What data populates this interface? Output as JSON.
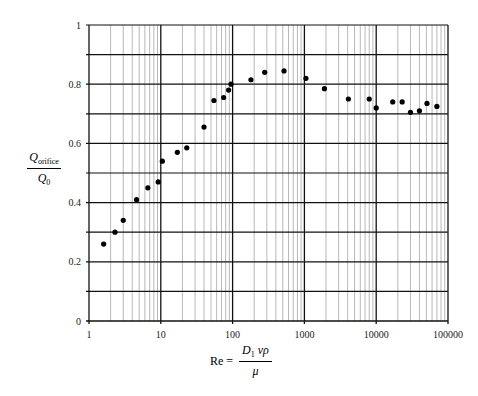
{
  "chart_data": {
    "type": "scatter",
    "title": "",
    "xlabel": "Re = D1 v ρ / μ",
    "ylabel": "Q_orifice / Q_0",
    "xscale": "log",
    "xlim": [
      1,
      100000
    ],
    "ylim": [
      0,
      1
    ],
    "x_ticks": [
      "1",
      "10",
      "100",
      "1000",
      "10000",
      "100000"
    ],
    "y_ticks": [
      "0",
      "0.2",
      "0.4",
      "0.6",
      "0.8",
      "1"
    ],
    "grid": true,
    "legend": null,
    "series": [
      {
        "name": "measured",
        "x": [
          1.6,
          2.3,
          3.0,
          4.6,
          6.6,
          9.2,
          10.5,
          17,
          23,
          40,
          55,
          75,
          88,
          95,
          180,
          280,
          520,
          1050,
          1900,
          4100,
          8000,
          10000,
          17000,
          23000,
          30000,
          40000,
          51000,
          70000
        ],
        "y": [
          0.26,
          0.3,
          0.34,
          0.41,
          0.45,
          0.47,
          0.54,
          0.57,
          0.585,
          0.655,
          0.745,
          0.755,
          0.78,
          0.8,
          0.815,
          0.84,
          0.845,
          0.82,
          0.785,
          0.75,
          0.75,
          0.72,
          0.74,
          0.74,
          0.705,
          0.71,
          0.735,
          0.725
        ]
      }
    ]
  },
  "labels": {
    "y_num": "Q",
    "y_num_sub": "orifice",
    "y_den": "Q",
    "y_den_sub": "0",
    "x_lhs": "Re =",
    "x_num": "D",
    "x_num_sub": "1",
    "x_num_rest": "vρ",
    "x_den": "μ"
  }
}
